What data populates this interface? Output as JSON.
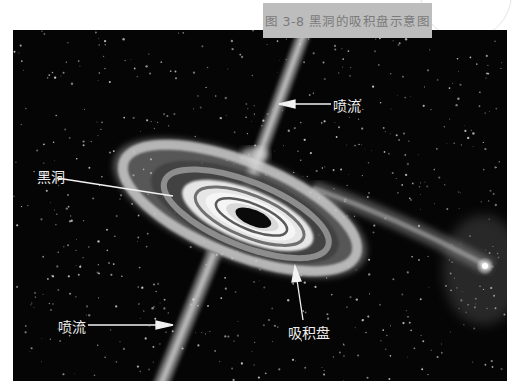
{
  "figure": {
    "caption": "图 3-8  黑洞的吸积盘示意图",
    "background_color": "#050505",
    "caption_box_color": "#bdbdbd",
    "caption_text_color": "#7a7a7a"
  },
  "labels": {
    "jet_top": "喷流",
    "black_hole": "黑洞",
    "accretion_disk": "吸积盘",
    "jet_bottom": "喷流"
  }
}
